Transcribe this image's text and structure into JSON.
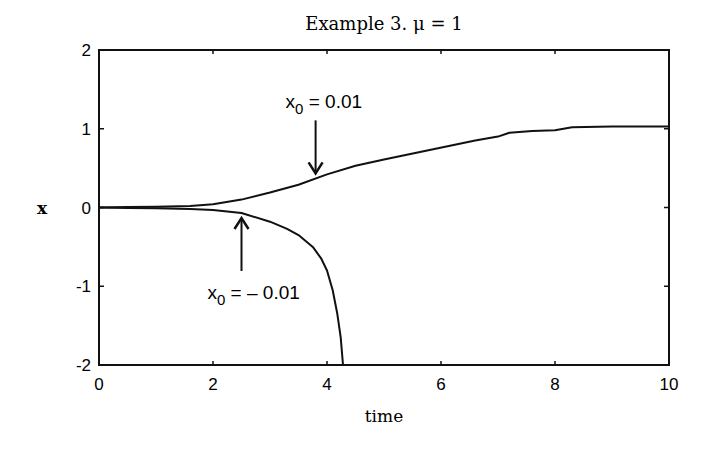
{
  "chart_data": {
    "type": "line",
    "title": "Example 3.  μ = 1",
    "xlabel": "time",
    "ylabel": "x",
    "xlim": [
      0,
      10
    ],
    "ylim": [
      -2,
      2
    ],
    "xticks": [
      0,
      2,
      4,
      6,
      8,
      10
    ],
    "xtick_labels": [
      "0",
      "2",
      "4",
      "6",
      "8",
      "10"
    ],
    "yticks": [
      2,
      1,
      0,
      -1,
      -2
    ],
    "ytick_labels": [
      "2",
      "1",
      "0",
      "-1",
      "-2"
    ],
    "grid": false,
    "legend": "none",
    "series": [
      {
        "name": "x0 = 0.01",
        "x": [
          0,
          0.5,
          1.0,
          1.6,
          2.0,
          2.5,
          3.0,
          3.5,
          4.0,
          4.5,
          5.0,
          5.4,
          5.8,
          6.2,
          6.6,
          7.0,
          7.2,
          7.6,
          8.0,
          8.3,
          9.0,
          10.0
        ],
        "y": [
          0.0,
          0.005,
          0.01,
          0.02,
          0.04,
          0.1,
          0.19,
          0.29,
          0.42,
          0.53,
          0.61,
          0.67,
          0.73,
          0.79,
          0.85,
          0.9,
          0.95,
          0.97,
          0.98,
          1.02,
          1.03,
          1.03
        ]
      },
      {
        "name": "x0 = -0.01",
        "x": [
          0,
          0.5,
          1.0,
          1.6,
          2.0,
          2.5,
          3.0,
          3.3,
          3.5,
          3.75,
          3.9,
          4.0,
          4.1,
          4.18,
          4.24,
          4.28
        ],
        "y": [
          0.0,
          -0.005,
          -0.01,
          -0.02,
          -0.03,
          -0.07,
          -0.18,
          -0.27,
          -0.35,
          -0.5,
          -0.65,
          -0.8,
          -1.05,
          -1.35,
          -1.65,
          -2.0
        ]
      }
    ],
    "annotations": [
      {
        "text_main": "x",
        "text_sub": "0",
        "text_rest": " = 0.01",
        "arrow": "down",
        "points_to": [
          3.8,
          0.37
        ]
      },
      {
        "text_main": "x",
        "text_sub": "0",
        "text_rest": " = – 0.01",
        "arrow": "up",
        "points_to": [
          2.5,
          -0.07
        ]
      }
    ]
  }
}
